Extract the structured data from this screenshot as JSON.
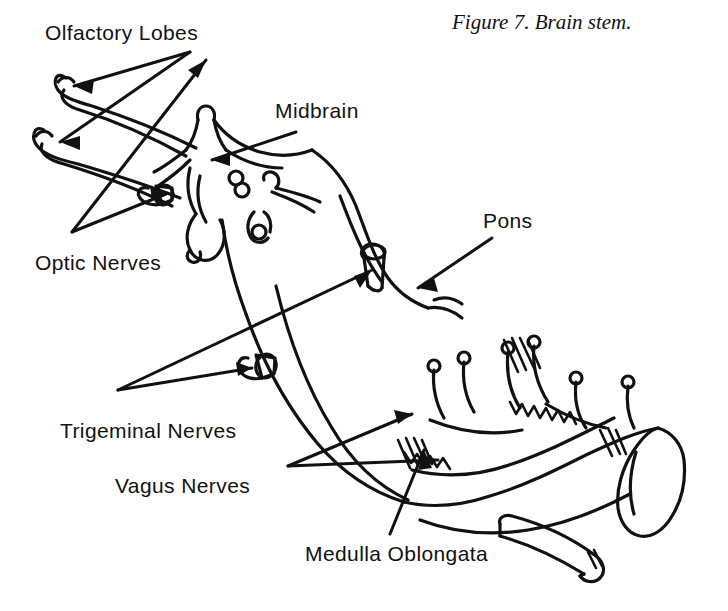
{
  "figure": {
    "caption": "Figure 7.   Brain stem.",
    "caption_number": "Figure 7.",
    "caption_title": "Brain stem.",
    "background_color": "#ffffff",
    "ink_color": "#111111",
    "width": 728,
    "height": 611
  },
  "labels": {
    "olfactory_lobes": "Olfactory Lobes",
    "optic_nerves": "Optic Nerves",
    "midbrain": "Midbrain",
    "pons": "Pons",
    "trigeminal_nerves": "Trigeminal Nerves",
    "vagus_nerves": "Vagus Nerves",
    "medulla_oblongata": "Medulla Oblongata"
  },
  "annotations": [
    {
      "label": "Olfactory Lobes",
      "x": 45,
      "y": 22,
      "arrows": 2,
      "points_to": "olfactory-lobe-tips"
    },
    {
      "label": "Midbrain",
      "x": 275,
      "y": 100,
      "arrows": 1,
      "points_to": "midbrain-body"
    },
    {
      "label": "Pons",
      "x": 483,
      "y": 210,
      "arrows": 1,
      "points_to": "pons-body"
    },
    {
      "label": "Optic Nerves",
      "x": 35,
      "y": 252,
      "arrows": 2,
      "points_to": "optic-nerve-stumps"
    },
    {
      "label": "Trigeminal Nerves",
      "x": 60,
      "y": 420,
      "arrows": 2,
      "points_to": "trigeminal-nerve-stumps"
    },
    {
      "label": "Vagus Nerves",
      "x": 115,
      "y": 475,
      "arrows": 2,
      "points_to": "vagus-nerve-roots"
    },
    {
      "label": "Medulla Oblongata",
      "x": 305,
      "y": 543,
      "arrows": 1,
      "points_to": "medulla-body"
    }
  ],
  "structures": [
    "olfactory-lobe-left",
    "olfactory-lobe-right",
    "optic-nerve-stump",
    "midbrain-body",
    "cranial-nerve-stubs",
    "pons-body",
    "trigeminal-nerve-stump",
    "medulla-body",
    "vagus-nerve-roots",
    "spinal-cord-end"
  ]
}
